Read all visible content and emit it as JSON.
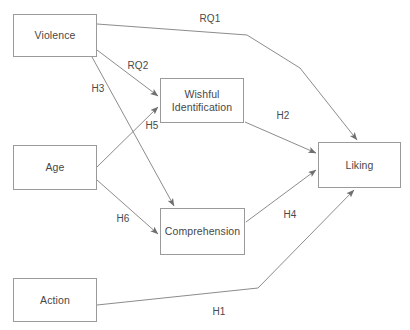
{
  "diagram": {
    "stroke_color": "#8c8c8c",
    "box_border_color": "#9a9a9a",
    "text_color": "#474747",
    "background": "#ffffff",
    "nodes": [
      {
        "id": "violence",
        "label": "Violence",
        "x": 13,
        "y": 14,
        "w": 84,
        "h": 43
      },
      {
        "id": "wishful",
        "label": "Wishful\nIdentification",
        "line1": "Wishful",
        "line2": "Identification",
        "x": 160,
        "y": 78,
        "w": 84,
        "h": 45
      },
      {
        "id": "age",
        "label": "Age",
        "x": 13,
        "y": 145,
        "w": 84,
        "h": 45
      },
      {
        "id": "liking",
        "label": "Liking",
        "x": 318,
        "y": 142,
        "w": 83,
        "h": 46
      },
      {
        "id": "comprehension",
        "label": "Comprehension",
        "x": 160,
        "y": 208,
        "w": 85,
        "h": 47
      },
      {
        "id": "action",
        "label": "Action",
        "x": 13,
        "y": 278,
        "w": 84,
        "h": 44
      }
    ],
    "edges": [
      {
        "id": "rq1",
        "label": "RQ1",
        "from": "violence",
        "to": "liking",
        "label_x": 210,
        "label_y": 18
      },
      {
        "id": "rq2",
        "label": "RQ2",
        "from": "violence",
        "to": "wishful",
        "label_x": 138,
        "label_y": 65
      },
      {
        "id": "h3",
        "label": "H3",
        "from": "violence",
        "to": "comprehension",
        "label_x": 98,
        "label_y": 88
      },
      {
        "id": "h5",
        "label": "H5",
        "from": "age",
        "to": "wishful",
        "label_x": 152,
        "label_y": 125
      },
      {
        "id": "h6",
        "label": "H6",
        "from": "age",
        "to": "comprehension",
        "label_x": 123,
        "label_y": 218
      },
      {
        "id": "h2",
        "label": "H2",
        "from": "wishful",
        "to": "liking",
        "label_x": 283,
        "label_y": 115
      },
      {
        "id": "h4",
        "label": "H4",
        "from": "comprehension",
        "to": "liking",
        "label_x": 290,
        "label_y": 214
      },
      {
        "id": "h1",
        "label": "H1",
        "from": "action",
        "to": "liking",
        "label_x": 219,
        "label_y": 311
      }
    ]
  }
}
